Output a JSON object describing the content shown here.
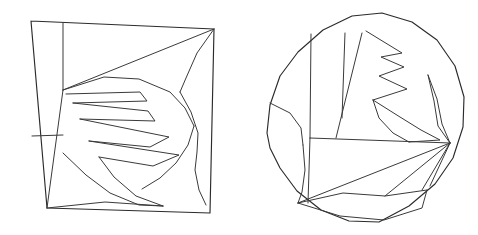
{
  "page": {
    "background_color": "#ffffff",
    "width": 478,
    "height": 235,
    "stroke_color": "#2b2b2b",
    "stroke_width": 1.15
  },
  "figures": [
    {
      "id": "left-figure",
      "name": "square-partition",
      "shape": "square",
      "label": "",
      "outline_points": "31,21 214,29 210,213 47,208 31,21",
      "bounds": {
        "x": 31,
        "y": 21,
        "width": 183,
        "height": 192
      },
      "internal_lines": [
        {
          "name": "left-vertical-divider",
          "points": "63,23 63,90"
        },
        {
          "name": "left-short-horizontal",
          "points": "32,136 63,135"
        },
        {
          "name": "diagonal-to-bottom-left",
          "points": "63,90 47,208"
        },
        {
          "name": "upper-long-diagonal",
          "points": "63,90 214,29"
        },
        {
          "name": "right-curve-from-corner",
          "points": "214,29 197,53 186,78 180,92"
        },
        {
          "name": "outer-curve-right-lobe",
          "points": "180,92 191,112 198,133 197,152 195,170 199,190 206,205"
        },
        {
          "name": "leaf-spine-upper",
          "points": "63,90 104,77 139,79 170,92 185,108 194,126"
        },
        {
          "name": "zigzag-row-1",
          "points": "66,94 140,92 147,101 73,103"
        },
        {
          "name": "zigzag-row-2",
          "points": "73,103 148,111 155,121 80,119"
        },
        {
          "name": "zigzag-row-3",
          "points": "80,119 169,137 150,147 89,141"
        },
        {
          "name": "zigzag-row-4",
          "points": "89,141 179,155 153,166 99,157"
        },
        {
          "name": "lower-leaf-curve-1",
          "points": "99,157 114,177 136,196 163,206"
        },
        {
          "name": "lower-leaf-curve-2",
          "points": "63,153 86,175 110,193 139,205 163,206"
        },
        {
          "name": "bottom-zigzag",
          "points": "47,208 105,202 163,206"
        },
        {
          "name": "leaf-lower-outline",
          "points": "194,126 188,145 176,163 160,178 142,189"
        }
      ]
    },
    {
      "id": "right-figure",
      "name": "circle-partition",
      "shape": "circle",
      "label": "",
      "center": {
        "x": 366,
        "y": 117
      },
      "radius": 105,
      "outline_points": "267,133 270,105 280,76 298,52 323,30 352,16 382,13 412,22 437,40 455,66 464,97 463,127 453,158 435,184 409,206 379,222 349,221 321,210 297,191 280,168 270,148 267,133",
      "internal_lines": [
        {
          "name": "vertical-divider-left",
          "points": "311,34 310,138"
        },
        {
          "name": "vertical-divider-mid",
          "points": "345,33 342,118"
        },
        {
          "name": "diagonal-divider",
          "points": "362,33 336,138"
        },
        {
          "name": "horizontal-midline",
          "points": "310,138 450,143"
        },
        {
          "name": "left-arc-upper",
          "points": "270,103 290,113 301,128 303,145"
        },
        {
          "name": "left-arc-lower",
          "points": "303,145 305,170 302,192 298,203"
        },
        {
          "name": "left-lower-vertical",
          "points": "310,138 308,203"
        },
        {
          "name": "zigzag-top",
          "points": "366,31 402,53 381,57 404,67 379,76 407,89 373,100"
        },
        {
          "name": "zigzag-lower",
          "points": "373,100 400,117 421,130 440,140 409,142"
        },
        {
          "name": "zigzag-tail",
          "points": "409,142 393,133 379,118 373,100"
        },
        {
          "name": "right-lens-outer",
          "points": "428,75 437,99 442,124 450,143"
        },
        {
          "name": "right-lens-inner",
          "points": "428,75 434,101 438,126 450,143"
        },
        {
          "name": "fan-line-1",
          "points": "450,143 298,203"
        },
        {
          "name": "fan-line-2",
          "points": "450,143 385,196"
        },
        {
          "name": "fan-line-3",
          "points": "450,143 430,186"
        },
        {
          "name": "fan-line-4",
          "points": "450,143 422,190"
        },
        {
          "name": "bottom-zigzag-inner",
          "points": "298,203 343,193 385,196 427,190"
        },
        {
          "name": "bottom-zigzag-outer",
          "points": "298,203 340,216 384,220 422,208 427,190"
        }
      ]
    }
  ]
}
